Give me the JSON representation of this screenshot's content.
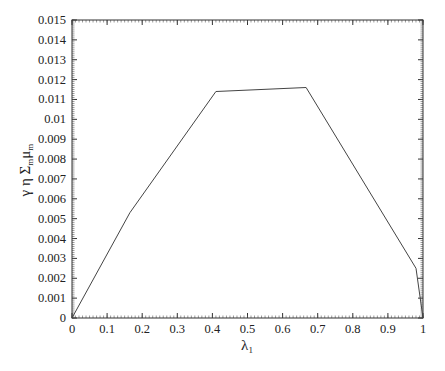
{
  "chart_data": {
    "type": "line",
    "title": "",
    "xlabel": "λ1",
    "ylabel": "γ η Σm μm",
    "xlim": [
      0,
      1
    ],
    "ylim": [
      0,
      0.015
    ],
    "grid": false,
    "legend": null,
    "x_ticks": [
      "0",
      "0.1",
      "0.2",
      "0.3",
      "0.4",
      "0.5",
      "0.6",
      "0.7",
      "0.8",
      "0.9",
      "1"
    ],
    "y_ticks": [
      "0",
      "0.001",
      "0.002",
      "0.003",
      "0.004",
      "0.005",
      "0.006",
      "0.007",
      "0.008",
      "0.009",
      "0.01",
      "0.011",
      "0.012",
      "0.013",
      "0.014",
      "0.015"
    ],
    "series": [
      {
        "name": "γ η Σm μm",
        "x": [
          0,
          0.165,
          0.41,
          0.667,
          0.98,
          1.0
        ],
        "y": [
          0,
          0.0053,
          0.0114,
          0.0116,
          0.0025,
          0
        ]
      }
    ]
  },
  "axes": {
    "xlabel_main": "λ",
    "xlabel_sub": "1",
    "ylabel_parts": [
      "γ η Σ",
      "m",
      "μ",
      "m"
    ]
  }
}
